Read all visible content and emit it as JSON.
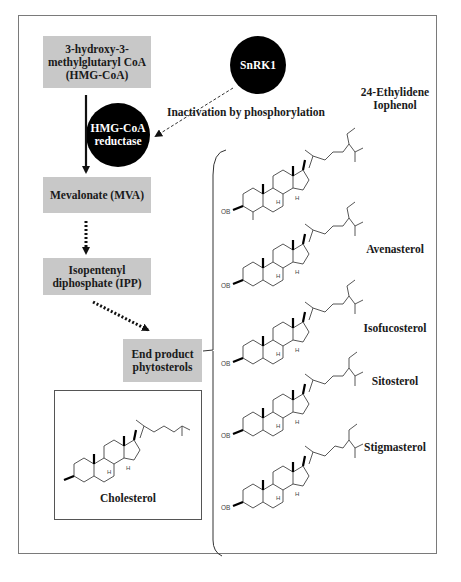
{
  "pathway": {
    "nodes": [
      {
        "id": "hmg_coa",
        "label_lines": [
          "3-hydroxy-3-",
          "methylglutaryl CoA",
          "(HMG-CoA)"
        ]
      },
      {
        "id": "mevalonate",
        "label": "Mevalonate (MVA)"
      },
      {
        "id": "ipp",
        "label_lines": [
          "Isopentenyl",
          "diphosphate (IPP)"
        ]
      },
      {
        "id": "end_product",
        "label_lines": [
          "End product",
          "phytosterols"
        ]
      }
    ],
    "enzymes": [
      {
        "id": "hmg_reductase",
        "label_lines": [
          "HMG-CoA",
          "reductase"
        ]
      },
      {
        "id": "snrk1",
        "label": "SnRK1"
      }
    ],
    "regulation_label": "Inactivation by phosphorylation",
    "colors": {
      "node_fill": "#c8c8c8",
      "enzyme_fill": "#000000",
      "enzyme_text": "#ffffff",
      "frame": "#7a7a7a"
    }
  },
  "cholesterol": {
    "label": "Cholesterol"
  },
  "phytosterols": [
    {
      "name_lines": [
        "24-Ethylidene",
        "Iophenol"
      ]
    },
    {
      "name_lines": [
        "Avenasterol"
      ]
    },
    {
      "name_lines": [
        "Isofucosterol"
      ]
    },
    {
      "name_lines": [
        "Sitosterol"
      ]
    },
    {
      "name_lines": [
        "Stigmasterol"
      ]
    }
  ],
  "structure_labels": {
    "ob": "OB",
    "h": "H"
  }
}
